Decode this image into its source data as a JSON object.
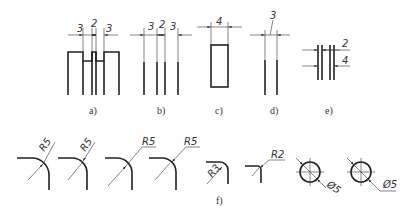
{
  "figure": {
    "subfigures": [
      {
        "id": "a",
        "caption": "a)",
        "dims": [
          "3",
          "2",
          "3"
        ]
      },
      {
        "id": "b",
        "caption": "b)",
        "dims": [
          "3",
          "2",
          "3"
        ]
      },
      {
        "id": "c",
        "caption": "c)",
        "dims": [
          "4"
        ]
      },
      {
        "id": "d",
        "caption": "d)",
        "dims": [
          "3"
        ]
      },
      {
        "id": "e",
        "caption": "e)",
        "dims": [
          "2",
          "4"
        ]
      }
    ],
    "radius_row": {
      "caption": "f)",
      "labels": [
        "R5",
        "R5",
        "R5",
        "R5",
        "R3",
        "R2",
        "Ø5",
        "Ø5"
      ]
    }
  }
}
